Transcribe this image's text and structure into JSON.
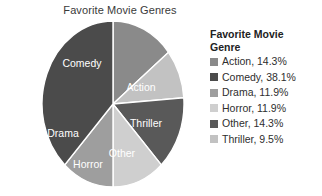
{
  "chart_data": {
    "type": "pie",
    "title": "Favorite Movie Genres",
    "categories": [
      "Action",
      "Comedy",
      "Drama",
      "Horror",
      "Other",
      "Thriller"
    ],
    "values": [
      14.3,
      38.1,
      11.9,
      11.9,
      14.3,
      9.5
    ],
    "value_unit": "%",
    "colors": [
      "#8a8a8a",
      "#4b4b4b",
      "#9e9e9e",
      "#cfcfcf",
      "#595959",
      "#c2c2c2"
    ],
    "legend_position": "right",
    "grid": false,
    "slices": [
      {
        "label": "Action",
        "value": 14.3,
        "color": "#8a8a8a",
        "label_fill": "#ffffff"
      },
      {
        "label": "Thriller",
        "value": 9.5,
        "color": "#c2c2c2",
        "label_fill": "#ffffff"
      },
      {
        "label": "Other",
        "value": 14.3,
        "color": "#595959",
        "label_fill": "#ffffff"
      },
      {
        "label": "Horror",
        "value": 11.9,
        "color": "#cfcfcf",
        "label_fill": "#ffffff"
      },
      {
        "label": "Drama",
        "value": 11.9,
        "color": "#9e9e9e",
        "label_fill": "#ffffff"
      },
      {
        "label": "Comedy",
        "value": 38.1,
        "color": "#4b4b4b",
        "label_fill": "#ffffff"
      }
    ]
  },
  "legend": {
    "title_line1": "Favorite Movie",
    "title_line2": "Genre",
    "items": [
      {
        "swatch": "#8a8a8a",
        "text": "Action, 14.3%"
      },
      {
        "swatch": "#4b4b4b",
        "text": "Comedy, 38.1%"
      },
      {
        "swatch": "#9e9e9e",
        "text": "Drama, 11.9%"
      },
      {
        "swatch": "#cfcfcf",
        "text": "Horror, 11.9%"
      },
      {
        "swatch": "#595959",
        "text": "Other, 14.3%"
      },
      {
        "swatch": "#c2c2c2",
        "text": "Thriller, 9.5%"
      }
    ]
  },
  "slice_labels": {
    "comedy": "Comedy",
    "action": "Action",
    "thriller": "Thriller",
    "other": "Other",
    "horror": "Horror",
    "drama": "Drama"
  }
}
